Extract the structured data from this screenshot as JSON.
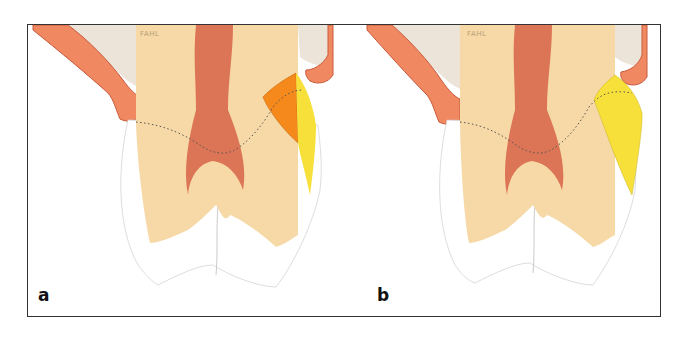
{
  "figure": {
    "panels": [
      {
        "label": "a",
        "signature": "FAHL",
        "restoration_layers": [
          "orange-opaque-layer",
          "yellow-translucent-layer"
        ]
      },
      {
        "label": "b",
        "signature": "FAHL",
        "restoration_layers": [
          "yellow-translucent-layer"
        ]
      }
    ]
  },
  "colors": {
    "dentin": "#f6d9a6",
    "pulp": "#dc7456",
    "gingiva": "#f08862",
    "bone_background": "#ece4d8",
    "enamel": "#ffffff",
    "orange_layer": "#f5891c",
    "yellow_layer": "#f7e03a",
    "frame": "#333333"
  }
}
